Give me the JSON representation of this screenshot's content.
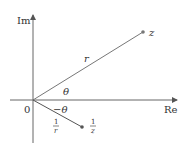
{
  "diagram": {
    "axes": {
      "x_label": "Re",
      "y_label": "Im",
      "origin_label": "0"
    },
    "points": [
      {
        "name": "z",
        "label": "z"
      },
      {
        "name": "reciprocal",
        "label_num": "1",
        "label_den": "z"
      }
    ],
    "segments": {
      "z_modulus_label": "r",
      "reciprocal_modulus_num": "1",
      "reciprocal_modulus_den": "r"
    },
    "angles": {
      "z_angle": "θ",
      "reciprocal_angle": "−θ"
    },
    "colors": {
      "line": "#555555",
      "point": "#666666",
      "text": "#333333"
    }
  }
}
